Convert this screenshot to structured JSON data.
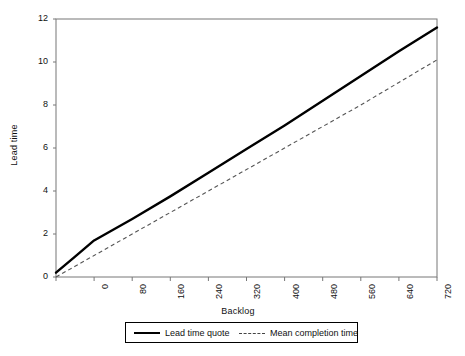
{
  "chart_data": {
    "type": "line",
    "title": "",
    "xlabel": "Backlog",
    "ylabel": "Lead time",
    "xlim": [
      0,
      800
    ],
    "ylim": [
      0,
      12
    ],
    "grid": false,
    "legend_position": "bottom",
    "xticks": [
      "0",
      "80",
      "160",
      "240",
      "320",
      "400",
      "480",
      "560",
      "640",
      "720",
      "800"
    ],
    "yticks": [
      "0",
      "2",
      "4",
      "6",
      "8",
      "10",
      "12"
    ],
    "x": [
      0,
      40,
      80,
      120,
      160,
      240,
      320,
      400,
      480,
      560,
      640,
      720,
      800
    ],
    "series": [
      {
        "name": "Lead time quote",
        "style": "solid",
        "color": "#000000",
        "values": [
          0.2,
          0.95,
          1.7,
          2.2,
          2.7,
          3.75,
          4.85,
          5.95,
          7.05,
          8.2,
          9.35,
          10.5,
          11.6
        ]
      },
      {
        "name": "Mean completion time",
        "style": "dashed",
        "color": "#555555",
        "values": [
          0.0,
          0.5,
          1.0,
          1.5,
          2.0,
          3.0,
          4.0,
          5.0,
          6.0,
          7.0,
          8.0,
          9.05,
          10.1
        ]
      }
    ]
  },
  "legend": {
    "entries": [
      {
        "label": "Lead time quote"
      },
      {
        "label": "Mean completion time"
      }
    ]
  },
  "axes": {
    "x_title": "Backlog",
    "y_title": "Lead time"
  }
}
